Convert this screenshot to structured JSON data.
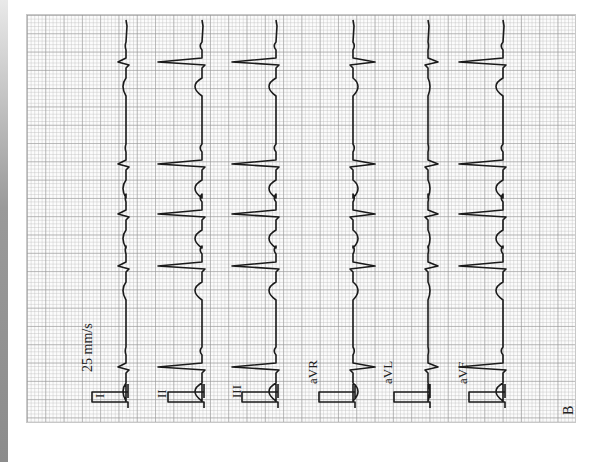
{
  "figure": {
    "panel_label": "B",
    "orientation": "rotated 90° counter-clockwise",
    "paper_speed": "25 mm/s",
    "grid_color": "#9a9a9a",
    "trace_color": "#1a1a1a",
    "leads": [
      {
        "name": "I",
        "label": "I",
        "baseline_x": 126,
        "polarity": "small-positive"
      },
      {
        "name": "II",
        "label": "II",
        "baseline_x": 202,
        "polarity": "positive"
      },
      {
        "name": "III",
        "label": "III",
        "baseline_x": 276,
        "polarity": "positive"
      },
      {
        "name": "aVR",
        "label": "aVR",
        "baseline_x": 353,
        "polarity": "negative"
      },
      {
        "name": "aVL",
        "label": "aVL",
        "baseline_x": 428,
        "polarity": "small-negative"
      },
      {
        "name": "aVF",
        "label": "aVF",
        "baseline_x": 503,
        "polarity": "positive"
      }
    ],
    "beat_positions_y": [
      62,
      164,
      214,
      266,
      367
    ]
  }
}
